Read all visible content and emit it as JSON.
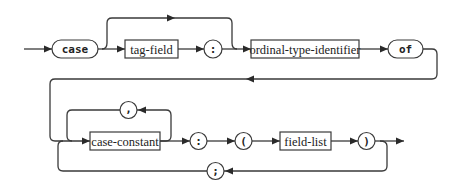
{
  "diagram": {
    "type": "syntax-diagram",
    "terminals": {
      "case": "case",
      "tag_colon": ":",
      "of": "of",
      "comma": ",",
      "label_colon": ":",
      "open_paren": "(",
      "close_paren": ")",
      "semicolon": ";"
    },
    "nonterminals": {
      "tag_field": "tag-field",
      "ordinal_type_identifier": "ordinal-type-identifier",
      "case_constant": "case-constant",
      "field_list": "field-list"
    },
    "colors": {
      "stroke": "#3a3a3a",
      "background": "#ffffff"
    }
  }
}
